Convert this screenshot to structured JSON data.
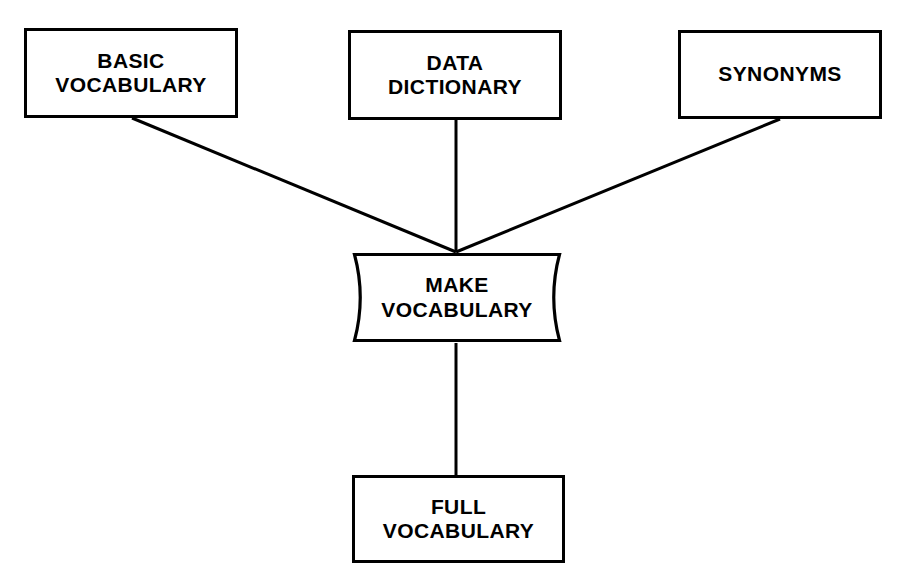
{
  "diagram": {
    "canvas": {
      "width": 905,
      "height": 585
    },
    "colors": {
      "background": "#ffffff",
      "stroke": "#000000",
      "text": "#000000"
    },
    "nodes": [
      {
        "id": "basic-vocabulary",
        "shape": "rectangle",
        "lines": [
          "BASIC",
          "VOCABULARY"
        ],
        "x": 24,
        "y": 28,
        "w": 214,
        "h": 90
      },
      {
        "id": "data-dictionary",
        "shape": "rectangle",
        "lines": [
          "DATA",
          "DICTIONARY"
        ],
        "x": 348,
        "y": 30,
        "w": 214,
        "h": 90
      },
      {
        "id": "synonyms",
        "shape": "rectangle",
        "lines": [
          "SYNONYMS"
        ],
        "x": 678,
        "y": 30,
        "w": 204,
        "h": 89
      },
      {
        "id": "make-vocabulary",
        "shape": "process",
        "lines": [
          "MAKE",
          "VOCABULARY"
        ],
        "x": 352,
        "y": 252,
        "w": 210,
        "h": 91
      },
      {
        "id": "full-vocabulary",
        "shape": "rectangle",
        "lines": [
          "FULL",
          "VOCABULARY"
        ],
        "x": 352,
        "y": 475,
        "w": 213,
        "h": 88
      }
    ],
    "edges": [
      {
        "id": "basic-to-make",
        "from": "basic-vocabulary",
        "to": "make-vocabulary",
        "kind": "diagonal",
        "points": [
          [
            132,
            118
          ],
          [
            456,
            252
          ]
        ]
      },
      {
        "id": "dictionary-to-make",
        "from": "data-dictionary",
        "to": "make-vocabulary",
        "kind": "vertical",
        "points": [
          [
            456,
            120
          ],
          [
            456,
            252
          ]
        ]
      },
      {
        "id": "synonyms-to-make",
        "from": "synonyms",
        "to": "make-vocabulary",
        "kind": "diagonal",
        "points": [
          [
            780,
            119
          ],
          [
            456,
            252
          ]
        ]
      },
      {
        "id": "make-to-full",
        "from": "make-vocabulary",
        "to": "full-vocabulary",
        "kind": "vertical",
        "points": [
          [
            456,
            343
          ],
          [
            456,
            475
          ]
        ]
      }
    ]
  }
}
